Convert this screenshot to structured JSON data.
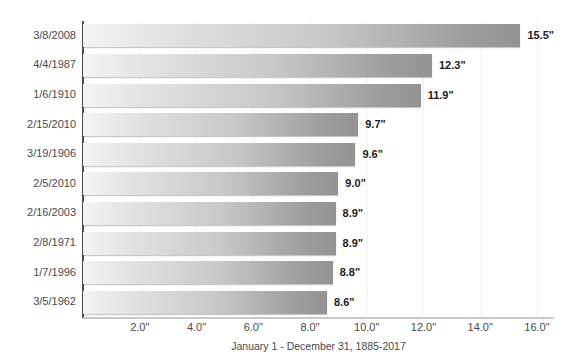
{
  "chart_data": {
    "type": "bar",
    "orientation": "horizontal",
    "title": "",
    "xlabel": "January 1 - December 31, 1885-2017",
    "ylabel": "",
    "categories": [
      "3/8/2008",
      "4/4/1987",
      "1/6/1910",
      "2/15/2010",
      "3/19/1906",
      "2/5/2010",
      "2/16/2003",
      "2/8/1971",
      "1/7/1996",
      "3/5/1962"
    ],
    "values": [
      15.5,
      12.3,
      11.9,
      9.7,
      9.6,
      9.0,
      8.9,
      8.9,
      8.8,
      8.6
    ],
    "value_labels": [
      "15.5\"",
      "12.3\"",
      "11.9\"",
      "9.7\"",
      "9.6\"",
      "9.0\"",
      "8.9\"",
      "8.9\"",
      "8.8\"",
      "8.6\""
    ],
    "xlim": [
      0,
      16.6
    ],
    "xticks": [
      2.0,
      4.0,
      6.0,
      8.0,
      10.0,
      12.0,
      14.0,
      16.0
    ],
    "xtick_labels": [
      "2.0\"",
      "4.0\"",
      "6.0\"",
      "8.0\"",
      "10.0\"",
      "12.0\"",
      "14.0\"",
      "16.0\""
    ],
    "grid": true,
    "grid_axis": "x",
    "legend": false,
    "unit": "inches",
    "colors": {
      "bar_gradient_start": "#f4f4f4",
      "bar_gradient_end": "#939393",
      "gridline": "#f2f2f2",
      "value_axis": "#4f4f4f",
      "category_axis": "#c9c9c9",
      "label_text": "#4a4a4a",
      "value_text": "#1c1c1c",
      "background": "#ffffff"
    }
  }
}
